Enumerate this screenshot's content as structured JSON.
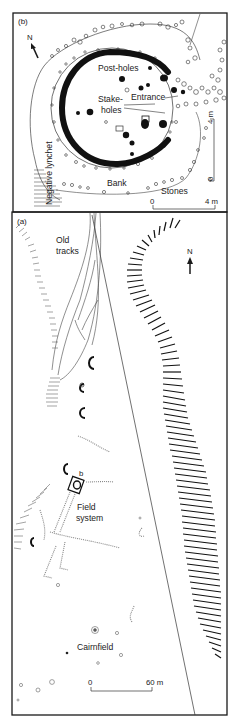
{
  "figure": {
    "panel_b": {
      "label": "(b)",
      "north_label": "N",
      "labels": {
        "post_holes": "Post-holes",
        "stake_holes_1": "Stake-",
        "stake_holes_2": "holes",
        "entrance": "Entrance",
        "bank": "Bank",
        "stones": "Stones",
        "negative_lynchet": "Negative lynchet"
      },
      "scale_h": {
        "start": "0",
        "end": "4 m"
      },
      "scale_v": {
        "start": "0",
        "end": "4 m"
      }
    },
    "panel_a": {
      "label": "(a)",
      "north_label": "N",
      "labels": {
        "old_tracks_1": "Old",
        "old_tracks_2": "tracks",
        "field_1": "Field",
        "field_2": "system",
        "cairnfield": "Cairnfield",
        "inset_ref": "b"
      },
      "scale": {
        "start": "0",
        "end": "60 m"
      }
    },
    "colors": {
      "ink": "#1a1a1a",
      "background": "#ffffff",
      "faint": "#9a9a9a"
    }
  }
}
